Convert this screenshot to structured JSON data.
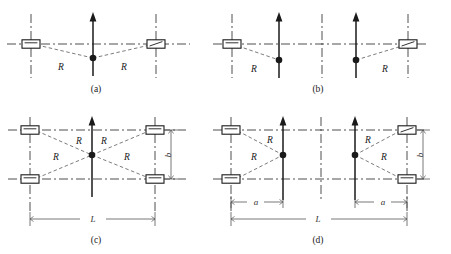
{
  "figure": {
    "title": "",
    "background_color": "#ffffff",
    "ink_color": "#1a1a1a",
    "dash_dot_color": "#3a3a3a",
    "dashed_color": "#5a5a5a",
    "dimension_color": "#555555"
  },
  "labels": {
    "R": "R",
    "L": "L",
    "a": "a",
    "b": "b"
  },
  "panels": [
    {
      "id": "a",
      "caption": "(a)",
      "caption_x": 96,
      "caption_y": 92,
      "conductor_count": 2,
      "tower_count": 1,
      "r_labels": [
        "R",
        "R"
      ],
      "dimensions": []
    },
    {
      "id": "b",
      "caption": "(b)",
      "caption_x": 318,
      "caption_y": 92,
      "conductor_count": 2,
      "tower_count": 2,
      "r_labels": [
        "R",
        "R"
      ],
      "dimensions": []
    },
    {
      "id": "c",
      "caption": "(c)",
      "caption_x": 96,
      "caption_y": 243,
      "conductor_count": 4,
      "tower_count": 1,
      "r_labels": [
        "R",
        "R",
        "R",
        "R"
      ],
      "dimensions": [
        "L",
        "b"
      ]
    },
    {
      "id": "d",
      "caption": "(d)",
      "caption_x": 318,
      "caption_y": 243,
      "conductor_count": 4,
      "tower_count": 2,
      "r_labels": [
        "R",
        "R",
        "R",
        "R"
      ],
      "dimensions": [
        "L",
        "a",
        "a",
        "b"
      ]
    }
  ]
}
